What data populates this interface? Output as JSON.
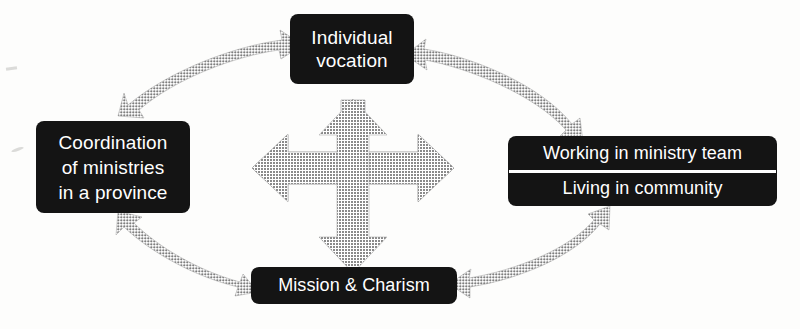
{
  "diagram": {
    "type": "concept-relationship-diagram",
    "background_color": "#fdfdfc",
    "node_fill_color": "#141414",
    "node_text_color": "#ffffff",
    "arrow_color": "#8c8c8c",
    "nodes": {
      "top": {
        "name": "individual-vocation",
        "lines": [
          "Individual",
          "vocation"
        ]
      },
      "left": {
        "name": "coordination-of-ministries",
        "lines": [
          "Coordination",
          "of ministries",
          "in a province"
        ]
      },
      "right": {
        "name": "ministry-team-and-community",
        "cells": [
          "Working in ministry team",
          "Living in community"
        ]
      },
      "bottom": {
        "name": "mission-and-charism",
        "lines": [
          "Mission & Charism"
        ]
      }
    },
    "connectors": {
      "center_cross": {
        "label": "four-way-double-arrow",
        "directions": [
          "up",
          "down",
          "left",
          "right"
        ]
      },
      "curved": [
        {
          "label": "left-to-top",
          "double_headed": true
        },
        {
          "label": "top-to-right",
          "double_headed": true
        },
        {
          "label": "left-to-bottom",
          "double_headed": true
        },
        {
          "label": "bottom-to-right",
          "double_headed": true
        }
      ]
    }
  }
}
